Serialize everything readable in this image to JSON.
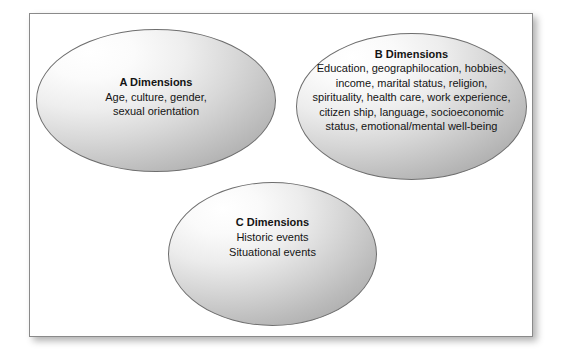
{
  "figure": {
    "type": "three-ellipse-venn-style-diagram",
    "background_color": "#ffffff",
    "frame_border_color": "#8a8a8a",
    "ellipse_border_color": "#6e6e6e",
    "ellipse_fill_light": "#ffffff",
    "ellipse_fill_dark": "#9a9a9a",
    "text_color": "#141414"
  },
  "ellipses": [
    {
      "id": "a",
      "title": "A Dimensions",
      "lines": [
        "Age, culture, gender,",
        "sexual orientation"
      ]
    },
    {
      "id": "b",
      "title": "B Dimensions",
      "lines": [
        "Education, geographilocation, hobbies,",
        "income, marital status, religion,",
        "spirituality, health care, work experience,",
        "citizen ship, language, socioeconomic",
        "status, emotional/mental well-being"
      ]
    },
    {
      "id": "c",
      "title": "C Dimensions",
      "lines": [
        "Historic events",
        "Situational events"
      ]
    }
  ]
}
